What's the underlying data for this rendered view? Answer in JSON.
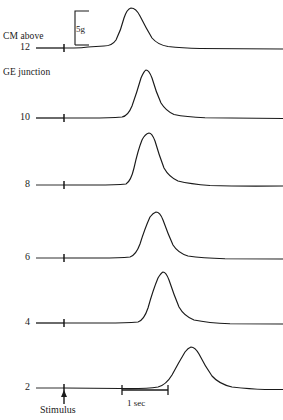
{
  "figure": {
    "axis_title_line1": "CM above",
    "axis_title_line2": "GE junction",
    "stimulus_label": "Stimulus",
    "amplitude_scale_label": "5g",
    "time_scale_label": "1 sec",
    "line_color": "#1a1a1a",
    "background_color": "#ffffff"
  },
  "chart_data": {
    "type": "line",
    "title": "",
    "xlabel": "",
    "ylabel": "CM above GE junction",
    "tick_labels": [
      "12",
      "10",
      "8",
      "6",
      "4",
      "2"
    ],
    "grid": false,
    "legend": null,
    "annotations": [
      {
        "name": "stimulus-marker",
        "label": "Stimulus",
        "x_px": 64
      },
      {
        "name": "amplitude-scale",
        "label": "5g",
        "length_px": 35
      },
      {
        "name": "time-scale",
        "label": "1 sec",
        "length_px": 46
      }
    ],
    "x_units": "seconds",
    "y_units": "grams",
    "seconds_per_pixel": 0.0217,
    "series": [
      {
        "name": "12",
        "depth_cm": 12,
        "baseline_y": 48,
        "peak_x": 130,
        "peak_y": 8,
        "amplitude_px": 40,
        "onset_x": 112,
        "return_x": 185,
        "path": "M 64 48 L 74 48 Q 82 48 88 47 L 104 46 Q 112 46 116 40 Q 121 30 124 18 Q 127 9 131 8 Q 136 8 140 16 Q 146 28 152 38 Q 158 45 168 46.5 Q 182 48 200 48.5 L 283 49"
      },
      {
        "name": "10",
        "depth_cm": 10,
        "baseline_y": 118,
        "peak_x": 145,
        "peak_y": 70,
        "amplitude_px": 48,
        "onset_x": 122,
        "return_x": 200,
        "path": "M 64 118 L 90 118 Q 110 118 122 117 Q 128 116 132 106 Q 137 92 141 78 Q 144 71 146 70 Q 149 70 152 78 Q 156 92 161 103 Q 166 111 174 114.5 Q 186 117 205 117.8 L 283 118.5"
      },
      {
        "name": "8",
        "depth_cm": 8,
        "baseline_y": 185,
        "peak_x": 148,
        "peak_y": 133,
        "amplitude_px": 52,
        "onset_x": 126,
        "return_x": 210,
        "path": "M 64 185 L 96 185 Q 116 185 126 184 Q 131 181 134 168 Q 138 150 142 140 Q 145 134 149 133 Q 152 133 155 141 Q 159 155 164 168 Q 169 177 178 181 Q 190 184 210 185.5 Q 240 186.5 283 186"
      },
      {
        "name": "6",
        "depth_cm": 6,
        "baseline_y": 258,
        "peak_x": 155,
        "peak_y": 212,
        "amplitude_px": 46,
        "onset_x": 130,
        "return_x": 215,
        "path": "M 64 258 L 100 258 Q 120 258 130 257 Q 136 255 140 244 Q 145 228 150 217 Q 153 213 156 212 Q 160 212 163 220 Q 168 234 173 245 Q 178 253 188 256 Q 202 258 225 258.8 L 283 259"
      },
      {
        "name": "4",
        "depth_cm": 4,
        "baseline_y": 323,
        "peak_x": 162,
        "peak_y": 272,
        "amplitude_px": 51,
        "onset_x": 138,
        "return_x": 222,
        "path": "M 64 323 L 106 323 Q 126 323 138 322 Q 144 320 148 308 Q 153 290 158 278 Q 161 273 163 272 Q 166 272 169 280 Q 174 295 179 307 Q 184 316 194 320 Q 208 323 230 323.8 L 283 324"
      },
      {
        "name": "2",
        "depth_cm": 2,
        "baseline_y": 388,
        "peak_x": 190,
        "peak_y": 347,
        "amplitude_px": 41,
        "onset_x": 158,
        "return_x": 250,
        "path": "M 64 388 L 120 388.5 Q 146 389 158 387 Q 166 385 172 375 Q 179 362 185 352 Q 188 348 191 347 Q 195 347 199 354 Q 205 366 212 376 Q 219 384 232 387 Q 250 389 265 389.5 L 283 389.5"
      }
    ]
  }
}
